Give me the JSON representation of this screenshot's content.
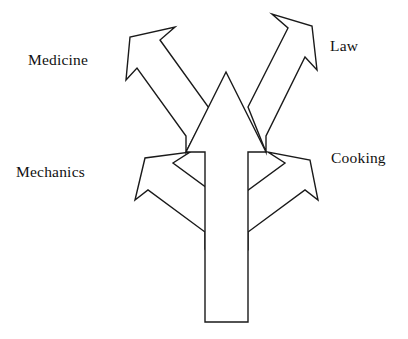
{
  "canvas": {
    "width": 408,
    "height": 339,
    "background": "#ffffff",
    "stroke_color": "#1a1a1a",
    "fill_color": "#ffffff",
    "text_color": "#111111"
  },
  "labels": {
    "medicine": "Medicine",
    "law": "Law",
    "mechanics": "Mechanics",
    "cooking": "Cooking"
  },
  "diagram": {
    "type": "branching-arrow",
    "trunk_direction": "up",
    "branch_count": 4,
    "branches": [
      {
        "label": "Medicine",
        "direction": "up-left",
        "level": "upper"
      },
      {
        "label": "Law",
        "direction": "up-right",
        "level": "upper"
      },
      {
        "label": "Mechanics",
        "direction": "up-left",
        "level": "lower"
      },
      {
        "label": "Cooking",
        "direction": "up-right",
        "level": "lower"
      }
    ]
  },
  "shapes": {
    "trunk": "M 205 322 L 205 152 L 186 152 L 226 72 L 266 152 L 248 152 L 248 322 Z",
    "branch_medicine": "M 186 152 L 186 136 L 137 68 L 126 80 L 130 37 L 175 27 L 160 40 L 209 108 Z",
    "branch_law": "M 266 152 L 266 136 L 305 57 L 317 70 L 312 26 L 272 14 L 288 28 L 248 107 Z",
    "branch_mechanics": "M 205 248 L 205 232 L 148 190 L 135 200 L 145 158 L 190 152 L 173 163 L 230 205 Z",
    "branch_cooking": "M 248 248 L 248 232 L 305 190 L 318 200 L 310 160 L 268 152 L 285 163 L 228 205 Z"
  }
}
